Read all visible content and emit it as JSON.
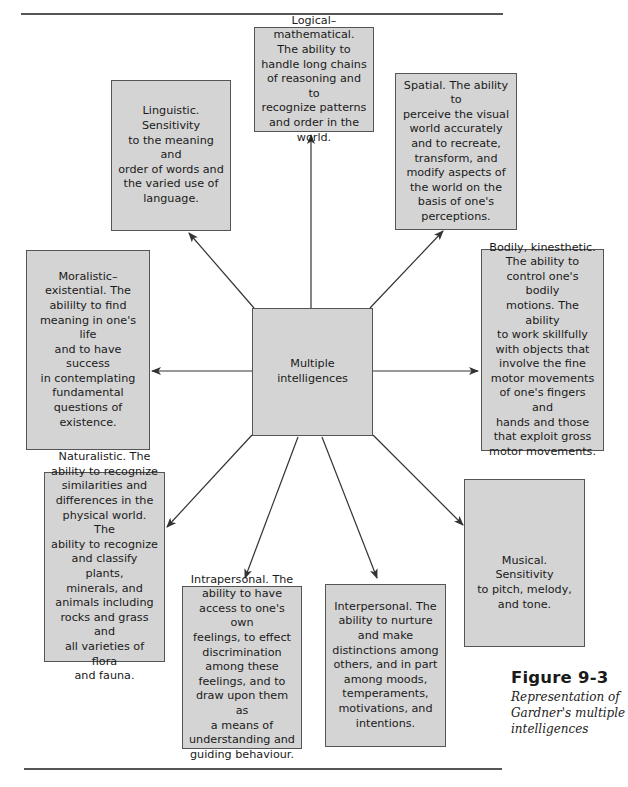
{
  "diagram": {
    "center": {
      "label": "Multiple intelligences"
    },
    "nodes": [
      {
        "id": "logical-mathematical",
        "text": "Logical–mathematical. The ability to handle long chains of reasoning and to recognize patterns and order in the world."
      },
      {
        "id": "linguistic",
        "text": "Linguistic. Sensitivity to the meaning and order of words and the varied use of language."
      },
      {
        "id": "spatial",
        "text": "Spatial. The ability to perceive the visual world accurately and to recreate, transform, and modify aspects of the world on the basis of one's perceptions."
      },
      {
        "id": "moralistic-existential",
        "text": "Moralistic–existential. The abililty to find meaning in one's life and to have success in contemplating fundamental questions of existence."
      },
      {
        "id": "bodily-kinesthetic",
        "text": "Bodily, kinesthetic. The ability to control one's bodily motions. The ability to work skillfully with objects that involve the fine motor movements of one's fingers and hands and those that exploit gross motor movements."
      },
      {
        "id": "naturalistic",
        "text": "Naturalistic. The ability to recognize similarities and differences in the physical world. The ability to recognize and classify plants, minerals, and animals including rocks and grass and all varieties of flora and fauna."
      },
      {
        "id": "musical",
        "text": "Musical. Sensitivity to pitch, melody, and tone."
      },
      {
        "id": "intrapersonal",
        "text": "Intrapersonal. The ability to have access to one's own feelings, to effect discrimination among these feelings, and to draw upon them as a means of understanding and guiding behaviour."
      },
      {
        "id": "interpersonal",
        "text": "Interpersonal. The ability to nurture and make distinctions among others, and in part among moods, temperaments, motivations, and intentions."
      }
    ],
    "edges": [
      {
        "from": "center",
        "to": "logical-mathematical"
      },
      {
        "from": "center",
        "to": "linguistic"
      },
      {
        "from": "center",
        "to": "spatial"
      },
      {
        "from": "center",
        "to": "moralistic-existential"
      },
      {
        "from": "center",
        "to": "bodily-kinesthetic"
      },
      {
        "from": "center",
        "to": "naturalistic"
      },
      {
        "from": "center",
        "to": "musical"
      },
      {
        "from": "center",
        "to": "intrapersonal"
      },
      {
        "from": "center",
        "to": "interpersonal"
      }
    ]
  },
  "nodes_display": {
    "center": [
      "Multiple",
      "intelligences"
    ],
    "logical": [
      "Logical–mathematical.",
      "The ability to",
      "handle long chains",
      "of reasoning and to",
      "recognize patterns",
      "and order in the",
      "world."
    ],
    "linguistic": [
      "Linguistic. Sensitivity",
      "to the meaning and",
      "order of words and",
      "the varied use of",
      "language."
    ],
    "spatial": [
      "Spatial. The ability to",
      "perceive the visual",
      "world accurately",
      "and to recreate,",
      "transform, and",
      "modify aspects of",
      "the world on the",
      "basis of one's",
      "perceptions."
    ],
    "moralistic": [
      "Moralistic–",
      "existential. The",
      "abililty to find",
      "meaning in one's life",
      "and to have success",
      "in contemplating",
      "fundamental",
      "questions of",
      "existence."
    ],
    "bodily": [
      "Bodily, kinesthetic.",
      "The ability to",
      "control one's bodily",
      "motions. The ability",
      "to work skillfully",
      "with objects that",
      "involve the fine",
      "motor movements",
      "of one's fingers and",
      "hands and those",
      "that exploit gross",
      "motor movements."
    ],
    "naturalistic": [
      "Naturalistic. The",
      "ability to recognize",
      "similarities and",
      "differences in the",
      "physical world. The",
      "ability to recognize",
      "and classify plants,",
      "minerals, and",
      "animals including",
      "rocks and grass and",
      "all varieties of flora",
      "and fauna."
    ],
    "musical": [
      "Musical. Sensitivity",
      "to pitch, melody,",
      "and tone."
    ],
    "intrapersonal": [
      "Intrapersonal. The",
      "ability to have",
      "access to one's own",
      "feelings, to effect",
      "discrimination",
      "among these",
      "feelings, and to",
      "draw upon them as",
      "a means of",
      "understanding and",
      "guiding behaviour."
    ],
    "interpersonal": [
      "Interpersonal. The",
      "ability to nurture",
      "and make",
      "distinctions among",
      "others, and in part",
      "among moods,",
      "temperaments,",
      "motivations, and",
      "intentions."
    ]
  },
  "caption": {
    "figure_label": "Figure 9-3",
    "description_lines": [
      "Representation of",
      "Gardner's multiple",
      "intelligences"
    ]
  },
  "colors": {
    "box_fill": "#d4d4d4",
    "box_border": "#555555",
    "arrow": "#333333",
    "rule": "#555555"
  }
}
